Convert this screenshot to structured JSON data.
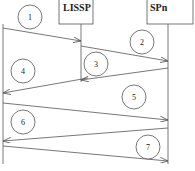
{
  "diagram": {
    "type": "sequence",
    "participants": [
      {
        "id": "left",
        "label": "",
        "x": 3
      },
      {
        "id": "lissp",
        "label": "LISSP",
        "x": 81
      },
      {
        "id": "spn",
        "label": "SPn",
        "x": 168
      }
    ],
    "messages": [
      {
        "step": "1",
        "from": "left",
        "to": "lissp"
      },
      {
        "step": "2",
        "from": "lissp",
        "to": "spn"
      },
      {
        "step": "3",
        "from": "spn",
        "to": "lissp"
      },
      {
        "step": "4",
        "from": "lissp",
        "to": "left"
      },
      {
        "step": "5",
        "from": "left",
        "to": "spn"
      },
      {
        "step": "6",
        "from": "spn",
        "to": "left"
      },
      {
        "step": "7",
        "from": "left",
        "to": "spn"
      }
    ],
    "colors": {
      "line": "#555555",
      "text": "#222222",
      "background": "#ffffff"
    }
  }
}
